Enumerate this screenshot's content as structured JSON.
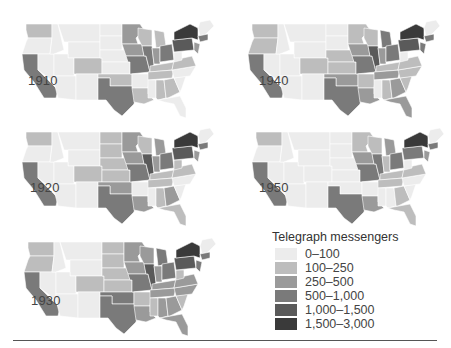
{
  "legend": {
    "title": "Telegraph messengers",
    "bins": [
      {
        "label": "0–100",
        "color": "#ececec"
      },
      {
        "label": "100–250",
        "color": "#bdbdbd"
      },
      {
        "label": "250–500",
        "color": "#9a9a9a"
      },
      {
        "label": "500–1,000",
        "color": "#7a7a7a"
      },
      {
        "label": "1,000–1,500",
        "color": "#5a5a5a"
      },
      {
        "label": "1,500–3,000",
        "color": "#3a3a3a"
      }
    ]
  },
  "maps": [
    {
      "year": "1910"
    },
    {
      "year": "1920"
    },
    {
      "year": "1930"
    },
    {
      "year": "1940"
    },
    {
      "year": "1950"
    }
  ],
  "chart_data": {
    "type": "heatmap",
    "subtype": "choropleth small multiples",
    "title": "",
    "legend_title": "Telegraph messengers",
    "legend_position": "bottom-right",
    "bins": [
      "0–100",
      "100–250",
      "250–500",
      "500–1,000",
      "1,000–1,500",
      "1,500–3,000"
    ],
    "panels": [
      {
        "year": 1910,
        "regions": {
          "WA": 1,
          "OR": 0,
          "CA": 3,
          "NV": 0,
          "ID": 0,
          "MT": 0,
          "WY": 0,
          "UT": 0,
          "CO": 1,
          "AZ": 0,
          "NM": 0,
          "ND": 0,
          "SD": 0,
          "NE": 0,
          "KS": 0,
          "OK": 1,
          "TX": 3,
          "MN": 2,
          "IA": 2,
          "MO": 3,
          "AR": 0,
          "LA": 1,
          "WI": 1,
          "IL": 3,
          "MI": 1,
          "IN": 2,
          "OH": 3,
          "KY": 1,
          "TN": 1,
          "MS": 0,
          "AL": 1,
          "GA": 1,
          "FL": 0,
          "SC": 0,
          "NC": 0,
          "VA": 1,
          "WV": 0,
          "PA": 4,
          "NY": 5,
          "NJ": 2,
          "New England": 0,
          "MA": 3
        }
      },
      {
        "year": 1920,
        "regions": {
          "WA": 1,
          "OR": 0,
          "CA": 3,
          "NV": 0,
          "ID": 0,
          "MT": 0,
          "WY": 0,
          "UT": 0,
          "CO": 1,
          "AZ": 0,
          "NM": 0,
          "ND": 1,
          "SD": 1,
          "NE": 1,
          "KS": 1,
          "OK": 2,
          "TX": 3,
          "MN": 2,
          "IA": 2,
          "MO": 3,
          "AR": 0,
          "LA": 2,
          "WI": 1,
          "IL": 4,
          "MI": 2,
          "IN": 2,
          "OH": 3,
          "KY": 1,
          "TN": 1,
          "MS": 0,
          "AL": 1,
          "GA": 2,
          "FL": 1,
          "SC": 0,
          "NC": 0,
          "VA": 1,
          "WV": 1,
          "PA": 4,
          "NY": 5,
          "NJ": 2,
          "New England": 0,
          "MA": 3
        }
      },
      {
        "year": 1930,
        "regions": {
          "WA": 1,
          "OR": 1,
          "CA": 3,
          "NV": 0,
          "ID": 0,
          "MT": 0,
          "WY": 0,
          "UT": 0,
          "CO": 1,
          "AZ": 0,
          "NM": 0,
          "ND": 1,
          "SD": 1,
          "NE": 1,
          "KS": 1,
          "OK": 3,
          "TX": 3,
          "MN": 2,
          "IA": 2,
          "MO": 3,
          "AR": 1,
          "LA": 2,
          "WI": 2,
          "IL": 4,
          "MI": 3,
          "IN": 2,
          "OH": 3,
          "KY": 2,
          "TN": 2,
          "MS": 1,
          "AL": 2,
          "GA": 2,
          "FL": 2,
          "SC": 1,
          "NC": 2,
          "VA": 2,
          "WV": 1,
          "PA": 4,
          "NY": 5,
          "NJ": 3,
          "New England": 0,
          "MA": 3
        }
      },
      {
        "year": 1940,
        "regions": {
          "WA": 1,
          "OR": 1,
          "CA": 3,
          "NV": 0,
          "ID": 0,
          "MT": 0,
          "WY": 0,
          "UT": 0,
          "CO": 1,
          "AZ": 0,
          "NM": 0,
          "ND": 0,
          "SD": 0,
          "NE": 1,
          "KS": 1,
          "OK": 2,
          "TX": 3,
          "MN": 1,
          "IA": 2,
          "MO": 3,
          "AR": 1,
          "LA": 2,
          "WI": 1,
          "IL": 4,
          "MI": 3,
          "IN": 2,
          "OH": 3,
          "KY": 1,
          "TN": 2,
          "MS": 0,
          "AL": 1,
          "GA": 2,
          "FL": 2,
          "SC": 1,
          "NC": 1,
          "VA": 1,
          "WV": 0,
          "PA": 4,
          "NY": 5,
          "NJ": 3,
          "New England": 0,
          "MA": 3
        }
      },
      {
        "year": 1950,
        "regions": {
          "WA": 1,
          "OR": 0,
          "CA": 3,
          "NV": 0,
          "ID": 0,
          "MT": 0,
          "WY": 0,
          "UT": 0,
          "CO": 0,
          "AZ": 0,
          "NM": 0,
          "ND": 0,
          "SD": 0,
          "NE": 0,
          "KS": 0,
          "OK": 0,
          "TX": 3,
          "MN": 1,
          "IA": 2,
          "MO": 3,
          "AR": 0,
          "LA": 2,
          "WI": 1,
          "IL": 3,
          "MI": 2,
          "IN": 1,
          "OH": 3,
          "KY": 1,
          "TN": 1,
          "MS": 0,
          "AL": 0,
          "GA": 1,
          "FL": 1,
          "SC": 0,
          "NC": 0,
          "VA": 1,
          "WV": 0,
          "PA": 3,
          "NY": 5,
          "NJ": 2,
          "New England": 0,
          "MA": 3
        }
      }
    ]
  }
}
